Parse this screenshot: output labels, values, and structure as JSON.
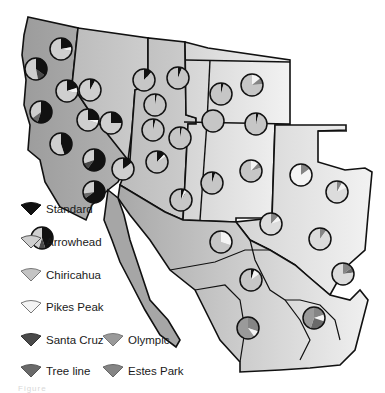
{
  "figure": {
    "type": "map-with-pie-charts",
    "region": "Western United States and Mexico",
    "caption_partial": "Figure"
  },
  "legend": {
    "items": [
      {
        "label": "Standard",
        "color": "#111111"
      },
      {
        "label": "Arrowhead",
        "color": "#cfcfcf"
      },
      {
        "label": "Chiricahua",
        "color": "#c4c4c4"
      },
      {
        "label": "Pikes Peak",
        "color": "#f4f4f4"
      },
      {
        "label": "Santa Cruz",
        "color": "#4a4a4a"
      },
      {
        "label": "Olympic",
        "color": "#9a9a9a"
      },
      {
        "label": "Tree line",
        "color": "#6a6a6a"
      },
      {
        "label": "Estes Park",
        "color": "#858585"
      }
    ]
  },
  "colors": {
    "coast_state": "#a9a9a9",
    "interior_state": "#c2c2c2",
    "east_state": "#dcdcdc",
    "border": "#111111",
    "pie_base": "#c6c6c6"
  },
  "pies": [
    {
      "x": 61,
      "y": 49,
      "slices": [
        {
          "c": "#111111",
          "p": 0.22
        },
        {
          "c": "#f4f4f4",
          "p": 0.06
        },
        {
          "c": "#cfcfcf",
          "p": 0.72
        }
      ]
    },
    {
      "x": 36,
      "y": 69,
      "slices": [
        {
          "c": "#111111",
          "p": 0.35
        },
        {
          "c": "#4a4a4a",
          "p": 0.12
        },
        {
          "c": "#cfcfcf",
          "p": 0.53
        }
      ]
    },
    {
      "x": 67,
      "y": 91,
      "slices": [
        {
          "c": "#111111",
          "p": 0.2
        },
        {
          "c": "#f4f4f4",
          "p": 0.08
        },
        {
          "c": "#cfcfcf",
          "p": 0.72
        }
      ]
    },
    {
      "x": 90,
      "y": 90,
      "slices": [
        {
          "c": "#111111",
          "p": 0.08
        },
        {
          "c": "#cfcfcf",
          "p": 0.92
        }
      ]
    },
    {
      "x": 41,
      "y": 112,
      "slices": [
        {
          "c": "#111111",
          "p": 0.55
        },
        {
          "c": "#6a6a6a",
          "p": 0.1
        },
        {
          "c": "#cfcfcf",
          "p": 0.35
        }
      ]
    },
    {
      "x": 88,
      "y": 120,
      "slices": [
        {
          "c": "#111111",
          "p": 0.25
        },
        {
          "c": "#f4f4f4",
          "p": 0.05
        },
        {
          "c": "#cfcfcf",
          "p": 0.7
        }
      ]
    },
    {
      "x": 111,
      "y": 123,
      "slices": [
        {
          "c": "#111111",
          "p": 0.25
        },
        {
          "c": "#cfcfcf",
          "p": 0.75
        }
      ]
    },
    {
      "x": 61,
      "y": 144,
      "slices": [
        {
          "c": "#111111",
          "p": 0.45
        },
        {
          "c": "#cfcfcf",
          "p": 0.55
        }
      ]
    },
    {
      "x": 94,
      "y": 160,
      "slices": [
        {
          "c": "#111111",
          "p": 0.6
        },
        {
          "c": "#4a4a4a",
          "p": 0.1
        },
        {
          "c": "#cfcfcf",
          "p": 0.3
        }
      ]
    },
    {
      "x": 123,
      "y": 169,
      "slices": [
        {
          "c": "#111111",
          "p": 0.15
        },
        {
          "c": "#cfcfcf",
          "p": 0.85
        }
      ]
    },
    {
      "x": 94,
      "y": 192,
      "slices": [
        {
          "c": "#111111",
          "p": 0.65
        },
        {
          "c": "#6a6a6a",
          "p": 0.08
        },
        {
          "c": "#cfcfcf",
          "p": 0.27
        }
      ]
    },
    {
      "x": 42,
      "y": 238,
      "slices": [
        {
          "c": "#111111",
          "p": 0.45
        },
        {
          "c": "#4a4a4a",
          "p": 0.1
        },
        {
          "c": "#cfcfcf",
          "p": 0.45
        }
      ]
    },
    {
      "x": 144,
      "y": 80,
      "slices": [
        {
          "c": "#111111",
          "p": 0.12
        },
        {
          "c": "#c6c6c6",
          "p": 0.88
        }
      ]
    },
    {
      "x": 178,
      "y": 78,
      "slices": [
        {
          "c": "#111111",
          "p": 0.06
        },
        {
          "c": "#c6c6c6",
          "p": 0.94
        }
      ]
    },
    {
      "x": 155,
      "y": 105,
      "slices": [
        {
          "c": "#111111",
          "p": 0.03
        },
        {
          "c": "#c6c6c6",
          "p": 0.97
        }
      ]
    },
    {
      "x": 153,
      "y": 130,
      "slices": [
        {
          "c": "#111111",
          "p": 0.04
        },
        {
          "c": "#c6c6c6",
          "p": 0.96
        }
      ]
    },
    {
      "x": 180,
      "y": 138,
      "slices": [
        {
          "c": "#111111",
          "p": 0.03
        },
        {
          "c": "#c6c6c6",
          "p": 0.97
        }
      ]
    },
    {
      "x": 157,
      "y": 162,
      "slices": [
        {
          "c": "#111111",
          "p": 0.12
        },
        {
          "c": "#f4f4f4",
          "p": 0.04
        },
        {
          "c": "#c6c6c6",
          "p": 0.84
        }
      ]
    },
    {
      "x": 181,
      "y": 200,
      "slices": [
        {
          "c": "#111111",
          "p": 0.05
        },
        {
          "c": "#f4f4f4",
          "p": 0.04
        },
        {
          "c": "#c6c6c6",
          "p": 0.91
        }
      ]
    },
    {
      "x": 221,
      "y": 94,
      "slices": [
        {
          "c": "#111111",
          "p": 0.04
        },
        {
          "c": "#c6c6c6",
          "p": 0.96
        }
      ]
    },
    {
      "x": 252,
      "y": 85,
      "slices": [
        {
          "c": "#f4f4f4",
          "p": 0.14
        },
        {
          "c": "#858585",
          "p": 0.1
        },
        {
          "c": "#c6c6c6",
          "p": 0.76
        }
      ]
    },
    {
      "x": 213,
      "y": 121,
      "slices": [
        {
          "c": "#c6c6c6",
          "p": 1.0
        }
      ]
    },
    {
      "x": 256,
      "y": 124,
      "slices": [
        {
          "c": "#111111",
          "p": 0.04
        },
        {
          "c": "#c6c6c6",
          "p": 0.96
        }
      ]
    },
    {
      "x": 251,
      "y": 171,
      "slices": [
        {
          "c": "#f4f4f4",
          "p": 0.12
        },
        {
          "c": "#858585",
          "p": 0.08
        },
        {
          "c": "#c6c6c6",
          "p": 0.8
        }
      ]
    },
    {
      "x": 212,
      "y": 183,
      "slices": [
        {
          "c": "#111111",
          "p": 0.05
        },
        {
          "c": "#c6c6c6",
          "p": 0.95
        }
      ]
    },
    {
      "x": 301,
      "y": 175,
      "slices": [
        {
          "c": "#858585",
          "p": 0.15
        },
        {
          "c": "#f4f4f4",
          "p": 0.85
        }
      ]
    },
    {
      "x": 337,
      "y": 192,
      "slices": [
        {
          "c": "#858585",
          "p": 0.08
        },
        {
          "c": "#f4f4f4",
          "p": 0.1
        },
        {
          "c": "#dcdcdc",
          "p": 0.82
        }
      ]
    },
    {
      "x": 271,
      "y": 224,
      "slices": [
        {
          "c": "#858585",
          "p": 0.12
        },
        {
          "c": "#f4f4f4",
          "p": 0.08
        },
        {
          "c": "#dcdcdc",
          "p": 0.8
        }
      ]
    },
    {
      "x": 320,
      "y": 239,
      "slices": [
        {
          "c": "#858585",
          "p": 0.1
        },
        {
          "c": "#dcdcdc",
          "p": 0.9
        }
      ]
    },
    {
      "x": 221,
      "y": 242,
      "slices": [
        {
          "c": "#f4f4f4",
          "p": 0.3
        },
        {
          "c": "#c6c6c6",
          "p": 0.7
        }
      ]
    },
    {
      "x": 343,
      "y": 274,
      "slices": [
        {
          "c": "#858585",
          "p": 0.15
        },
        {
          "c": "#6a6a6a",
          "p": 0.08
        },
        {
          "c": "#dcdcdc",
          "p": 0.77
        }
      ]
    },
    {
      "x": 251,
      "y": 280,
      "slices": [
        {
          "c": "#111111",
          "p": 0.05
        },
        {
          "c": "#f4f4f4",
          "p": 0.1
        },
        {
          "c": "#c6c6c6",
          "p": 0.85
        }
      ]
    },
    {
      "x": 314,
      "y": 318,
      "slices": [
        {
          "c": "#858585",
          "p": 0.2
        },
        {
          "c": "#f4f4f4",
          "p": 0.1
        },
        {
          "c": "#6a6a6a",
          "p": 0.25
        },
        {
          "c": "#9a9a9a",
          "p": 0.45
        }
      ]
    },
    {
      "x": 248,
      "y": 328,
      "slices": [
        {
          "c": "#858585",
          "p": 0.3
        },
        {
          "c": "#f4f4f4",
          "p": 0.1
        },
        {
          "c": "#9a9a9a",
          "p": 0.6
        }
      ]
    }
  ]
}
